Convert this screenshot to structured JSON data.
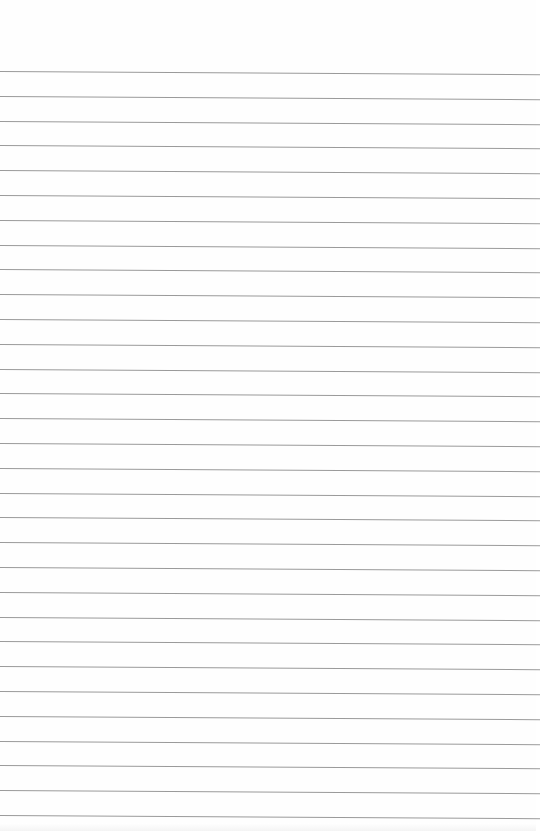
{
  "page": {
    "type": "blank-lined-paper",
    "background_color": "#fefefe",
    "rule_color": "#9a9a9a",
    "rule_count": 31,
    "first_rule_y": 71,
    "rule_spacing": 24.8
  }
}
